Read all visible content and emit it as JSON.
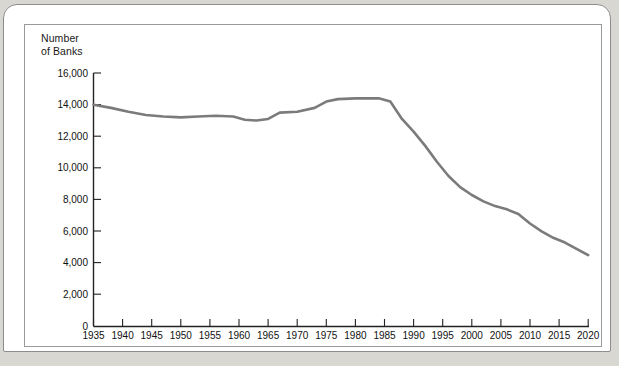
{
  "figure": {
    "axis_title": "Number\nof Banks",
    "line_color": "#7b7b7b",
    "axis_color": "#222222",
    "background": "#ffffff",
    "page_background": "#d9d7d2"
  },
  "chart_data": {
    "type": "line",
    "title": "",
    "subtitle": "",
    "xlabel": "",
    "ylabel": "Number of Banks",
    "grid": false,
    "legend": "none",
    "xlim": [
      1935,
      2021
    ],
    "ylim": [
      0,
      16000
    ],
    "ytick_labels": [
      "16,000",
      "14,000",
      "12,000",
      "10,000",
      "8,000",
      "6,000",
      "4,000",
      "2,000",
      "0"
    ],
    "ytick_values": [
      16000,
      14000,
      12000,
      10000,
      8000,
      6000,
      4000,
      2000,
      0
    ],
    "xtick_labels": [
      "1935",
      "1940",
      "1945",
      "1950",
      "1955",
      "1960",
      "1965",
      "1970",
      "1975",
      "1980",
      "1985",
      "1990",
      "1995",
      "2000",
      "2005",
      "2010",
      "2015",
      "2020"
    ],
    "xtick_values": [
      1935,
      1940,
      1945,
      1950,
      1955,
      1960,
      1965,
      1970,
      1975,
      1980,
      1985,
      1990,
      1995,
      2000,
      2005,
      2010,
      2015,
      2020
    ],
    "series": [
      {
        "name": "Number of Banks",
        "x": [
          1935,
          1938,
          1941,
          1944,
          1947,
          1950,
          1953,
          1956,
          1959,
          1961,
          1963,
          1965,
          1967,
          1970,
          1973,
          1975,
          1977,
          1980,
          1982,
          1984,
          1986,
          1988,
          1990,
          1992,
          1994,
          1996,
          1998,
          2000,
          2002,
          2004,
          2006,
          2008,
          2010,
          2012,
          2014,
          2016,
          2018,
          2020
        ],
        "y": [
          14000,
          13800,
          13550,
          13350,
          13250,
          13200,
          13250,
          13300,
          13250,
          13050,
          13000,
          13100,
          13500,
          13550,
          13800,
          14200,
          14350,
          14400,
          14400,
          14400,
          14200,
          13100,
          12300,
          11400,
          10400,
          9500,
          8800,
          8300,
          7900,
          7600,
          7400,
          7100,
          6500,
          6000,
          5600,
          5300,
          4900,
          4500
        ],
        "color": "#7b7b7b",
        "width": 2.6
      }
    ]
  }
}
